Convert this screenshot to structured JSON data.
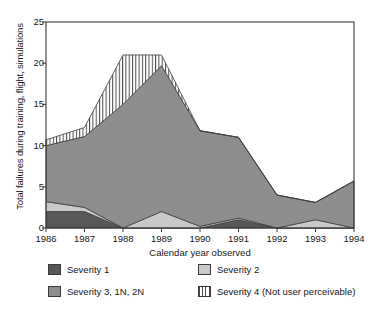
{
  "chart_data": {
    "type": "area",
    "stacked": true,
    "title": "",
    "xlabel": "Calendar year observed",
    "ylabel": "Total failures during training, flight, simulations",
    "categories": [
      "1986",
      "1987",
      "1988",
      "1989",
      "1990",
      "1991",
      "1992",
      "1993",
      "1994"
    ],
    "x": [
      1986,
      1987,
      1988,
      1989,
      1990,
      1991,
      1992,
      1993,
      1994
    ],
    "xlim": [
      1986,
      1994
    ],
    "ylim": [
      0,
      25
    ],
    "yticks": [
      0,
      5,
      10,
      15,
      20,
      25
    ],
    "xticks": [
      "1986",
      "1987",
      "1988",
      "1989",
      "1990",
      "1991",
      "1992",
      "1993",
      "1994"
    ],
    "grid": false,
    "legend_position": "below",
    "series": [
      {
        "name": "Severity 1",
        "color": "#585858",
        "pattern": "solid",
        "values": [
          2.0,
          2.0,
          0.0,
          0.0,
          0.0,
          1.0,
          0.0,
          0.0,
          0.0
        ]
      },
      {
        "name": "Severity 2",
        "color": "#c9c9c9",
        "pattern": "solid",
        "values": [
          1.2,
          0.5,
          0.0,
          2.0,
          0.2,
          0.2,
          0.0,
          1.0,
          0.0
        ]
      },
      {
        "name": "Severity 3, 1N, 2N",
        "color": "#8e8e8e",
        "pattern": "solid",
        "values": [
          6.8,
          8.6,
          15.0,
          17.7,
          11.6,
          9.8,
          4.0,
          2.1,
          5.7
        ]
      },
      {
        "name": "Severity 4 (Not user perceivable)",
        "color": "#ffffff",
        "pattern": "vertical-hatch",
        "values": [
          0.7,
          1.1,
          6.0,
          1.3,
          0.0,
          0.0,
          0.0,
          0.0,
          0.0
        ]
      }
    ],
    "cumulative_totals": [
      10.7,
      12.2,
      21.0,
      21.0,
      11.8,
      11.0,
      4.0,
      3.1,
      5.7
    ]
  },
  "legend": {
    "items": [
      {
        "label": "Severity 1",
        "swatch": "severity-1-swatch"
      },
      {
        "label": "Severity 2",
        "swatch": "severity-2-swatch"
      },
      {
        "label": "Severity 3, 1N, 2N",
        "swatch": "severity-3-swatch"
      },
      {
        "label": "Severity 4 (Not user perceivable)",
        "swatch": "severity-4-swatch"
      }
    ]
  }
}
